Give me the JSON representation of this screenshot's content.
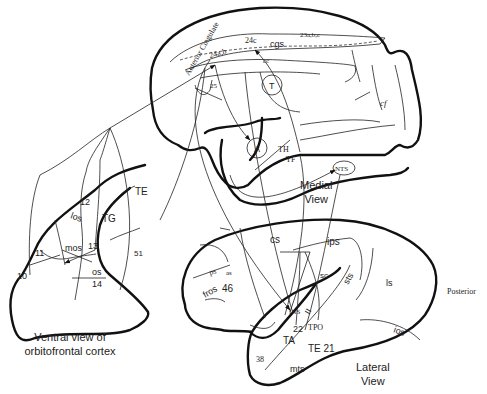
{
  "medial": {
    "caption": [
      "Medial",
      "View"
    ],
    "labels": {
      "anterior_cingulate": "Anterior  Cingulate",
      "a24ab": "24a,b",
      "a24c": "24c",
      "cgs": "cgs",
      "a23abc": "23a,b,c",
      "cc": "cc",
      "a25": "25",
      "T": "T",
      "A": "A",
      "TH": "TH",
      "TF": "TF",
      "NTS": "NTS",
      "cf": "cf"
    }
  },
  "ventral": {
    "caption": [
      "Ventral view of",
      "orbitofrontal cortex"
    ],
    "labels": {
      "a12": "12",
      "los": "los",
      "TE": "TE",
      "TG": "TG",
      "a11": "11",
      "mos": "mos",
      "a13": "13",
      "a51": "51",
      "a10": "10",
      "os": "os",
      "a14": "14"
    }
  },
  "lateral": {
    "caption": [
      "Lateral",
      "View"
    ],
    "posterior": "Posterior",
    "labels": {
      "as": "as",
      "ps": "ps",
      "a46": "46",
      "fros": "fros",
      "cs": "cs",
      "ips": "ips",
      "sc": "sc",
      "sts": "sts",
      "ls": "ls",
      "ios": "ios",
      "INS": "INS",
      "II": "II",
      "a22": "22",
      "TPO": "TPO",
      "TA": "TA",
      "TE21": "TE 21",
      "a38": "38",
      "mts": "mts"
    }
  }
}
